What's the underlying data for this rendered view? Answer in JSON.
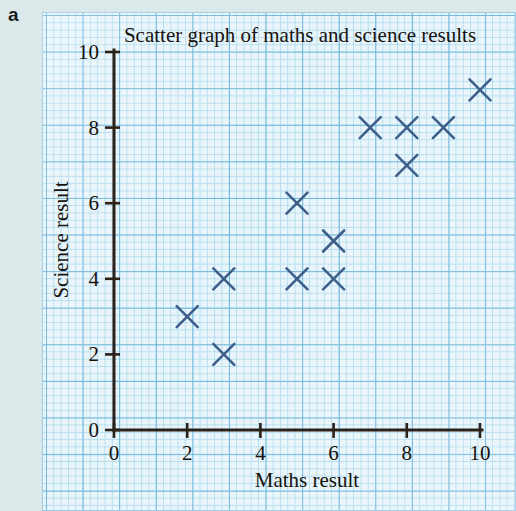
{
  "question_label": "a",
  "colors": {
    "page_background": "#dce9ea",
    "grid_background": "#e8f5fa",
    "grid_fine_line": "#b4dcef",
    "grid_bold_line": "#6fb6dd",
    "axis": "#2b2118",
    "marker": "#3d5f8a",
    "text": "#17120d"
  },
  "chart_data": {
    "type": "scatter",
    "title": "Scatter graph of maths and science results",
    "xlabel": "Maths result",
    "ylabel": "Science result",
    "xlim": [
      0,
      10
    ],
    "ylim": [
      0,
      10
    ],
    "xticks": [
      0,
      2,
      4,
      6,
      8,
      10
    ],
    "yticks": [
      0,
      2,
      4,
      6,
      8,
      10
    ],
    "xtick_labels": [
      "0",
      "2",
      "4",
      "6",
      "8",
      "10"
    ],
    "ytick_labels": [
      "0",
      "2",
      "4",
      "6",
      "8",
      "10"
    ],
    "grid": true,
    "grid_style": "graph-paper",
    "legend": false,
    "marker_style": "x",
    "points": [
      {
        "x": 2,
        "y": 3
      },
      {
        "x": 3,
        "y": 2
      },
      {
        "x": 3,
        "y": 4
      },
      {
        "x": 5,
        "y": 4
      },
      {
        "x": 5,
        "y": 6
      },
      {
        "x": 6,
        "y": 4
      },
      {
        "x": 6,
        "y": 5
      },
      {
        "x": 7,
        "y": 8
      },
      {
        "x": 8,
        "y": 7
      },
      {
        "x": 8,
        "y": 8
      },
      {
        "x": 9,
        "y": 8
      },
      {
        "x": 10,
        "y": 9
      }
    ]
  }
}
